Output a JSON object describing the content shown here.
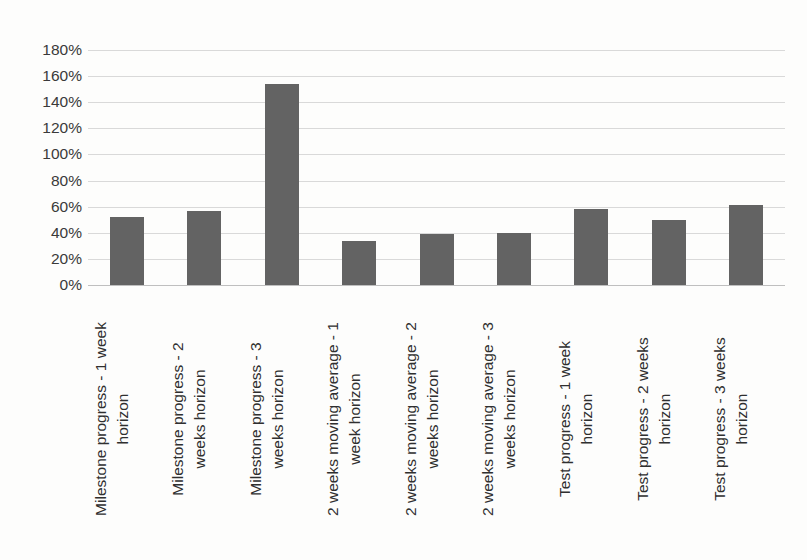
{
  "chart_data": {
    "type": "bar",
    "title": "",
    "subtitle": "",
    "xlabel": "",
    "ylabel": "",
    "ylim": [
      0,
      180
    ],
    "y_tick_labels": [
      "180%",
      "160%",
      "140%",
      "120%",
      "100%",
      "80%",
      "60%",
      "40%",
      "20%",
      "0%"
    ],
    "y_tick_values": [
      180,
      160,
      140,
      120,
      100,
      80,
      60,
      40,
      20,
      0
    ],
    "grid": true,
    "legend": false,
    "legend_position": "none",
    "value_suffix": "%",
    "bar_color": "#636363",
    "gridline_color": "#d9d9d9",
    "axis_color": "#bfbfbf",
    "categories": [
      "Milestone progress - 1 week horizon",
      "Milestone progress - 2 weeks horizon",
      "Milestone progress - 3 weeks horizon",
      "2 weeks moving average - 1 week horizon",
      "2 weeks moving average - 2 weeks horizon",
      "2 weeks moving average - 3 weeks horizon",
      "Test progress - 1 week horizon",
      "Test progress - 2 weeks horizon",
      "Test progress - 3 weeks horizon"
    ],
    "category_lines": [
      [
        "Milestone progress - 1 week",
        "horizon"
      ],
      [
        "Milestone progress - 2",
        "weeks horizon"
      ],
      [
        "Milestone progress - 3",
        "weeks horizon"
      ],
      [
        "2 weeks moving average - 1",
        "week horizon"
      ],
      [
        "2 weeks moving average - 2",
        "weeks horizon"
      ],
      [
        "2 weeks moving average - 3",
        "weeks horizon"
      ],
      [
        "Test progress - 1 week",
        "horizon"
      ],
      [
        "Test progress - 2 weeks",
        "horizon"
      ],
      [
        "Test progress - 3 weeks",
        "horizon"
      ]
    ],
    "values": [
      52,
      57,
      154,
      34,
      39,
      40,
      58,
      50,
      61
    ]
  }
}
